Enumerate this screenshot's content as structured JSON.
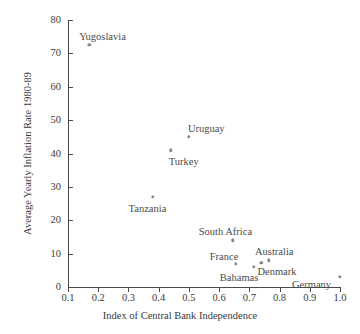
{
  "chart_data": {
    "type": "scatter",
    "title": "",
    "xlabel": "Index of Central Bank Independence",
    "ylabel": "Average Yearly Inflation Rate 1980-89",
    "xlim": [
      0.1,
      1.0
    ],
    "ylim": [
      0,
      80
    ],
    "xticks": [
      "0.1",
      "0.2",
      "0.3",
      "0.4",
      "0.5",
      "0.6",
      "0.7",
      "0.8",
      "0.9",
      "1.0"
    ],
    "xtick_values": [
      0.1,
      0.2,
      0.3,
      0.4,
      0.5,
      0.6,
      0.7,
      0.8,
      0.9,
      1.0
    ],
    "yticks": [
      "0",
      "10",
      "20",
      "30",
      "40",
      "50",
      "60",
      "70",
      "80"
    ],
    "ytick_values": [
      0,
      10,
      20,
      30,
      40,
      50,
      60,
      70,
      80
    ],
    "grid": false,
    "legend": "none",
    "marker_color": "#8a8a8a",
    "axis_color": "#4a4a4a",
    "points": [
      {
        "label": "Yugoslavia",
        "x": 0.17,
        "y": 72.5,
        "label_dx": -10,
        "label_dy": -14
      },
      {
        "label": "Uruguay",
        "x": 0.5,
        "y": 45.0,
        "label_dx": -1,
        "label_dy": -14
      },
      {
        "label": "Turkey",
        "x": 0.44,
        "y": 41.0,
        "label_dx": -2,
        "label_dy": 6
      },
      {
        "label": "Tanzania",
        "x": 0.38,
        "y": 27.0,
        "label_dx": -24,
        "label_dy": 6
      },
      {
        "label": "South Africa",
        "x": 0.645,
        "y": 14.0,
        "label_dx": -34,
        "label_dy": -14
      },
      {
        "label": "France",
        "x": 0.655,
        "y": 7.0,
        "label_dx": -26,
        "label_dy": -13
      },
      {
        "label": "Bahamas",
        "x": 0.715,
        "y": 6.0,
        "label_dx": -34,
        "label_dy": 5
      },
      {
        "label": "Denmark",
        "x": 0.74,
        "y": 7.2,
        "label_dx": -4,
        "label_dy": 3
      },
      {
        "label": "Australia",
        "x": 0.765,
        "y": 8.0,
        "label_dx": -14,
        "label_dy": -14
      },
      {
        "label": "Germany",
        "x": 1.0,
        "y": 3.0,
        "label_dx": -48,
        "label_dy": 2
      }
    ]
  }
}
